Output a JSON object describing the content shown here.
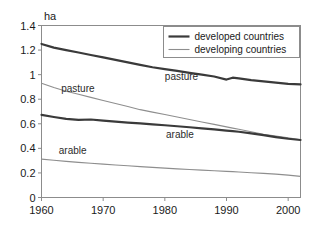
{
  "chart_data": {
    "type": "line",
    "title": "",
    "subtitle": "",
    "xlabel": "",
    "ylabel": "ha",
    "ylabel_position": "top-left-above-axis",
    "xlim": [
      1960,
      2002
    ],
    "ylim": [
      0,
      1.4
    ],
    "grid": false,
    "legend_position": "top-right",
    "background_color": "#ffffff",
    "axis_color": "#8c8c8c",
    "x_ticks": [
      1960,
      1970,
      1980,
      1990,
      2000
    ],
    "x_tick_labels": [
      "1960",
      "1970",
      "1980",
      "1990",
      "2000"
    ],
    "y_ticks": [
      0,
      0.2,
      0.4,
      0.6,
      0.8,
      1,
      1.2,
      1.4
    ],
    "y_tick_labels": [
      "0",
      "0.2",
      "0.4",
      "0.6",
      "0.8",
      "1",
      "1.2",
      "1.4"
    ],
    "legend": [
      {
        "name": "developed countries",
        "color": "#3a3a3a",
        "width": 2.2
      },
      {
        "name": "developing countries",
        "color": "#8e8e8e",
        "width": 1.1
      }
    ],
    "x": [
      1960,
      1962,
      1964,
      1966,
      1968,
      1970,
      1972,
      1974,
      1976,
      1978,
      1980,
      1982,
      1984,
      1986,
      1988,
      1990,
      1991,
      1992,
      1994,
      1996,
      1998,
      2000,
      2002
    ],
    "series": [
      {
        "name": "pasture (developed countries)",
        "group": "developed countries",
        "land_use": "pasture",
        "color": "#3a3a3a",
        "width": 2.2,
        "values": [
          1.25,
          1.22,
          1.2,
          1.18,
          1.16,
          1.14,
          1.12,
          1.1,
          1.08,
          1.06,
          1.045,
          1.03,
          1.015,
          1.0,
          0.985,
          0.96,
          0.975,
          0.97,
          0.955,
          0.945,
          0.935,
          0.925,
          0.92
        ]
      },
      {
        "name": "pasture (developing countries)",
        "group": "developing countries",
        "land_use": "pasture",
        "color": "#8e8e8e",
        "width": 1.1,
        "values": [
          0.93,
          0.895,
          0.865,
          0.84,
          0.815,
          0.79,
          0.765,
          0.74,
          0.715,
          0.695,
          0.675,
          0.655,
          0.635,
          0.615,
          0.595,
          0.575,
          0.565,
          0.555,
          0.535,
          0.515,
          0.5,
          0.485,
          0.47
        ]
      },
      {
        "name": "arable (developed countries)",
        "group": "developed countries",
        "land_use": "arable",
        "color": "#3a3a3a",
        "width": 2.2,
        "values": [
          0.672,
          0.655,
          0.64,
          0.632,
          0.635,
          0.625,
          0.617,
          0.61,
          0.603,
          0.595,
          0.588,
          0.58,
          0.572,
          0.563,
          0.555,
          0.545,
          0.54,
          0.535,
          0.522,
          0.508,
          0.492,
          0.478,
          0.468
        ]
      },
      {
        "name": "arable (developing countries)",
        "group": "developing countries",
        "land_use": "arable",
        "color": "#8e8e8e",
        "width": 1.1,
        "values": [
          0.312,
          0.303,
          0.294,
          0.286,
          0.279,
          0.272,
          0.265,
          0.258,
          0.251,
          0.245,
          0.239,
          0.233,
          0.228,
          0.223,
          0.218,
          0.213,
          0.211,
          0.208,
          0.202,
          0.196,
          0.19,
          0.182,
          0.172
        ]
      }
    ],
    "annotations": [
      {
        "text": "pasture",
        "x": 1963.2,
        "y": 0.855,
        "anchor": "start",
        "for_series": "pasture (developing countries)"
      },
      {
        "text": "pasture",
        "x": 1980.0,
        "y": 0.955,
        "anchor": "start",
        "for_series": "pasture (developed countries)"
      },
      {
        "text": "arable",
        "x": 1980.2,
        "y": 0.485,
        "anchor": "start",
        "for_series": "arable (developed countries)"
      },
      {
        "text": "arable",
        "x": 1962.8,
        "y": 0.355,
        "anchor": "start",
        "for_series": "arable (developing countries)"
      }
    ]
  }
}
